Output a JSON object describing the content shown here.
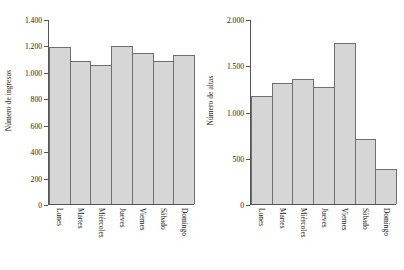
{
  "chart_data": [
    {
      "type": "bar",
      "panel": "left",
      "title": "",
      "xlabel": "",
      "ylabel": "Número de ingresos",
      "categories": [
        "Lunes",
        "Martes",
        "Miércoles",
        "Jueves",
        "Viernes",
        "Sábado",
        "Domingo"
      ],
      "values": [
        1185,
        1080,
        1055,
        1195,
        1140,
        1080,
        1130
      ],
      "ylim": [
        0,
        1400
      ],
      "yticks": [
        0,
        200,
        400,
        600,
        800,
        1000,
        1200,
        1400
      ],
      "ytick_labels": [
        "0",
        "200",
        "400",
        "600",
        "800",
        "1.000",
        "1.200",
        "1.400"
      ],
      "grid": false,
      "legend": "none",
      "bar_fill": "#d6d6d6",
      "bar_edge": "#6e6e6e"
    },
    {
      "type": "bar",
      "panel": "right",
      "title": "",
      "xlabel": "",
      "ylabel": "Número de altas",
      "categories": [
        "Lunes",
        "Martes",
        "Miércoles",
        "Jueves",
        "Viernes",
        "Sábado",
        "Domingo"
      ],
      "values": [
        1170,
        1310,
        1355,
        1265,
        1740,
        705,
        380
      ],
      "ylim": [
        0,
        2000
      ],
      "yticks": [
        0,
        500,
        1000,
        1500,
        2000
      ],
      "ytick_labels": [
        "0",
        "500",
        "1.000",
        "1.500",
        "2.000"
      ],
      "grid": false,
      "legend": "none",
      "bar_fill": "#d6d6d6",
      "bar_edge": "#6e6e6e"
    }
  ]
}
